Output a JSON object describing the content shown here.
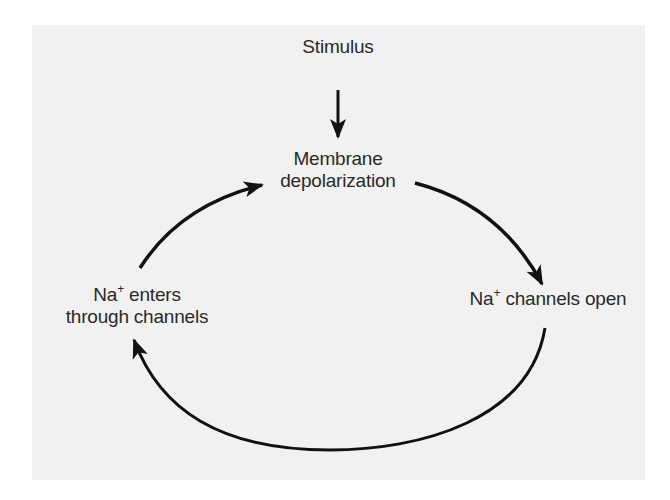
{
  "diagram": {
    "type": "cycle",
    "title": "",
    "colors": {
      "background": "#ffffff",
      "panel": "#f1f1f1",
      "text": "#2a2a2a",
      "arrow": "#111111"
    },
    "nodes": {
      "stimulus": {
        "label": "Stimulus"
      },
      "depolarization": {
        "line1": "Membrane",
        "line2": "depolarization"
      },
      "channels_open": {
        "prefix": "Na",
        "sup": "+",
        "rest": " channels open"
      },
      "na_enters": {
        "prefix": "Na",
        "sup": "+",
        "line1_rest": " enters",
        "line2": "through channels"
      }
    },
    "edges": [
      {
        "from": "stimulus",
        "to": "depolarization"
      },
      {
        "from": "depolarization",
        "to": "channels_open"
      },
      {
        "from": "channels_open",
        "to": "na_enters"
      },
      {
        "from": "na_enters",
        "to": "depolarization"
      }
    ]
  }
}
